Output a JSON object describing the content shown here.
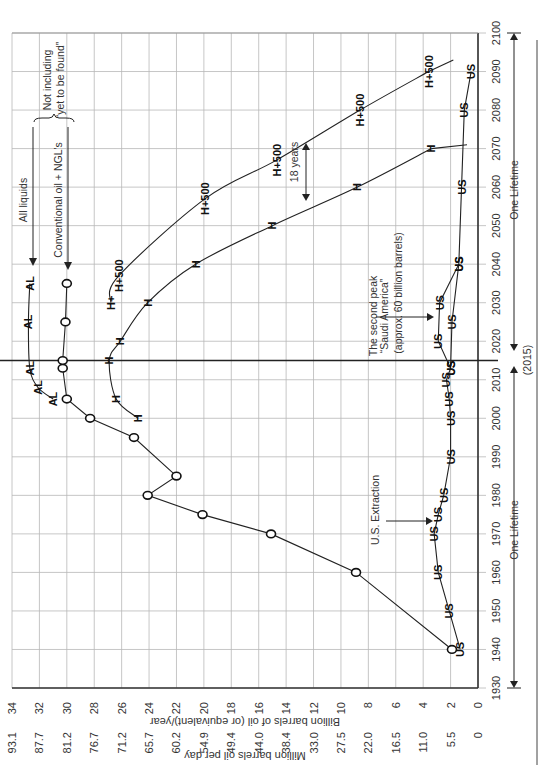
{
  "chart_data": {
    "type": "line",
    "orientation": "rotated 90° clockwise (years run bottom-to-top on right edge, values run right-to-left along bottom)",
    "title": "",
    "xlabel": "Year",
    "ylabel_primary": "Billion barrels of oil (or equivalent)/year",
    "ylabel_secondary": "Million barrels oil per day",
    "xlim": [
      1930,
      2100
    ],
    "ylim": [
      0,
      34
    ],
    "x_ticks": [
      1930,
      1940,
      1950,
      1960,
      1970,
      1980,
      1990,
      2000,
      2010,
      2020,
      2030,
      2040,
      2050,
      2060,
      2070,
      2080,
      2090,
      2100
    ],
    "y_ticks_primary": [
      0,
      2,
      4,
      6,
      8,
      10,
      12,
      14,
      16,
      18,
      20,
      22,
      24,
      26,
      28,
      30,
      32,
      34
    ],
    "y_ticks_secondary": [
      "0",
      "5.5",
      "11.0",
      "16.5",
      "22.0",
      "27.5",
      "33.0",
      "38.4",
      "44.0",
      "49.4",
      "54.9",
      "60.2",
      "65.7",
      "71.2",
      "76.7",
      "81.2",
      "87.7",
      "93.1"
    ],
    "grid": true,
    "series": [
      {
        "name": "All liquids",
        "marker": "AL",
        "x": [
          2005,
          2008,
          2013,
          2025,
          2035
        ],
        "values": [
          31.0,
          32.1,
          32.7,
          32.8,
          32.7
        ]
      },
      {
        "name": "Conventional oil + NGL's",
        "marker": "O",
        "x": [
          1940,
          1960,
          1970,
          1975,
          1980,
          1985,
          1995,
          2000,
          2005,
          2013,
          2015,
          2025,
          2035
        ],
        "values": [
          1.9,
          8.9,
          15.1,
          20.1,
          24.1,
          22.0,
          25.1,
          28.3,
          30.0,
          30.3,
          30.3,
          30.1,
          30.0
        ]
      },
      {
        "name": "H (Hubbert projection)",
        "marker": "H",
        "x": [
          2000,
          2005,
          2015,
          2020,
          2030,
          2040,
          2050,
          2060,
          2070
        ],
        "values": [
          24.8,
          26.4,
          26.9,
          26.1,
          24.1,
          20.6,
          15.0,
          8.8,
          3.4
        ]
      },
      {
        "name": "H+500",
        "marker": "H+500",
        "x": [
          2030,
          2037,
          2057,
          2067,
          2080,
          2090
        ],
        "values": [
          26.8,
          26.2,
          19.9,
          14.7,
          8.6,
          3.6
        ]
      },
      {
        "name": "U.S. Extraction",
        "marker": "US",
        "x": [
          1940,
          1950,
          1960,
          1970,
          1975,
          1980,
          1990,
          2000,
          2005,
          2010,
          2013,
          2020,
          2030,
          2040,
          2060,
          2080,
          2090
        ],
        "values": [
          1.3,
          2.1,
          2.9,
          3.2,
          2.9,
          2.5,
          2.0,
          2.0,
          2.1,
          2.3,
          2.0,
          2.9,
          2.8,
          1.4,
          1.2,
          1.0,
          0.5
        ]
      },
      {
        "name": "U.S. Extraction (lower branch)",
        "marker": "US",
        "x": [
          2013,
          2025,
          2040
        ],
        "values": [
          2.0,
          1.9,
          1.4
        ]
      }
    ],
    "annotations": [
      "All liquids",
      "Conventional oil + NGL's",
      "Not including “yet to be found”",
      "18 years",
      "The second peak “Saudi America” (approx. 60 billion barrels)",
      "U.S. Extraction",
      "One Lifetime",
      "(2015)"
    ]
  },
  "labels": {
    "ylabel_primary": "Billion barrels of oil (or equivalent)/year",
    "ylabel_secondary": "Million barrels oil per day",
    "all_liquids": "All liquids",
    "conventional": "Conventional oil + NGL's",
    "not_including_1": "Not including",
    "not_including_2": "“yet to be found”",
    "eighteen_years": "18 years",
    "second_peak_1": "The second peak",
    "second_peak_2": "“Saudi America”",
    "second_peak_3": "(approx. 60 billion barrels)",
    "us_extraction": "U.S. Extraction",
    "one_lifetime": "One Lifetime",
    "year_2015": "(2015)",
    "m_al": "AL",
    "m_h": "H",
    "m_hp": "H+500",
    "m_hplus": "H+",
    "m_us": "US"
  },
  "colors": {
    "grid": "#b8b8b8",
    "line": "#222222",
    "background": "#ffffff"
  }
}
